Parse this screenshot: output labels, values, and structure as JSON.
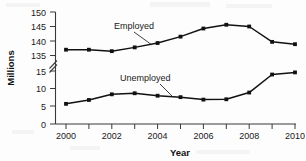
{
  "chart_data": {
    "type": "line",
    "title": "",
    "xlabel": "Year",
    "ylabel": "Millions",
    "x": [
      2000,
      2001,
      2002,
      2003,
      2004,
      2005,
      2006,
      2007,
      2008,
      2009,
      2010
    ],
    "xtick_labels": [
      "2000",
      "2002",
      "2004",
      "2006",
      "2008",
      "2010"
    ],
    "xtick_values": [
      2000,
      2002,
      2004,
      2006,
      2008,
      2010
    ],
    "xlim": [
      1999.5,
      2010.6
    ],
    "ytick_labels": [
      "0",
      "5",
      "10",
      "15",
      "135",
      "140",
      "145",
      "150"
    ],
    "ytick_values": [
      0,
      5,
      10,
      15,
      135,
      140,
      145,
      150
    ],
    "axis_broken": true,
    "axis_break_between": [
      15,
      135
    ],
    "grid": false,
    "legend_position": "inline-annotation",
    "series": [
      {
        "name": "Employed",
        "values": [
          137.0,
          137.0,
          136.5,
          137.8,
          139.3,
          141.5,
          144.3,
          145.6,
          145.0,
          139.7,
          138.9
        ]
      },
      {
        "name": "Unemployed",
        "values": [
          5.7,
          6.8,
          8.4,
          8.7,
          8.0,
          7.6,
          6.9,
          7.0,
          8.9,
          14.0,
          14.6
        ]
      }
    ],
    "annotations": [
      {
        "text": "Employed",
        "points_to_year": 2004
      },
      {
        "text": "Unemployed",
        "points_to_year": 2005
      }
    ]
  }
}
